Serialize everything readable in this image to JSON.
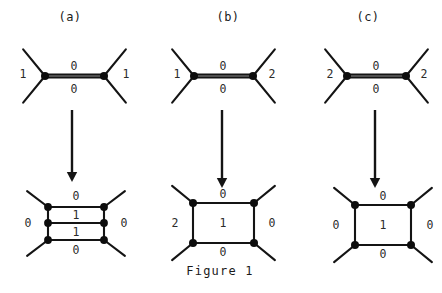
{
  "figure": {
    "caption": "Figure 1",
    "caption_x": 220,
    "caption_y": 271,
    "width": 442,
    "height": 293,
    "background_color": "#ffffff",
    "ink_color": "#141414"
  },
  "panels": [
    {
      "id": "a",
      "label": "(a)",
      "label_x": 70,
      "label_y": 10,
      "top_graph": {
        "type": "two-trivalent-vertices",
        "left_vertex": {
          "x": 45,
          "y": 76
        },
        "right_vertex": {
          "x": 104,
          "y": 76
        },
        "leg_length": 28,
        "labels": [
          {
            "name": "left-leg-label",
            "text": "1",
            "x": 23,
            "y": 74
          },
          {
            "name": "top-edge-label",
            "text": "0",
            "x": 74,
            "y": 66
          },
          {
            "name": "bottom-edge-label",
            "text": "0",
            "x": 74,
            "y": 89
          },
          {
            "name": "right-leg-label",
            "text": "1",
            "x": 126,
            "y": 74
          }
        ]
      },
      "arrow": {
        "x": 72,
        "y_start": 110,
        "y_end": 182
      },
      "bottom_graph": {
        "type": "ladder",
        "rungs": 3,
        "left_x": 48,
        "right_x": 104,
        "rung_ys": [
          207,
          223,
          240
        ],
        "leg_length": 22,
        "labels": [
          {
            "name": "top-label",
            "text": "0",
            "x": 76,
            "y": 196
          },
          {
            "name": "upper-cell-label",
            "text": "1",
            "x": 76,
            "y": 215
          },
          {
            "name": "lower-cell-label",
            "text": "1",
            "x": 76,
            "y": 232
          },
          {
            "name": "bottom-label",
            "text": "0",
            "x": 76,
            "y": 250
          },
          {
            "name": "left-label",
            "text": "0",
            "x": 28,
            "y": 223
          },
          {
            "name": "right-label",
            "text": "0",
            "x": 124,
            "y": 223
          }
        ]
      }
    },
    {
      "id": "b",
      "label": "(b)",
      "label_x": 228,
      "label_y": 10,
      "top_graph": {
        "type": "two-trivalent-vertices",
        "left_vertex": {
          "x": 194,
          "y": 76
        },
        "right_vertex": {
          "x": 253,
          "y": 76
        },
        "leg_length": 28,
        "labels": [
          {
            "name": "left-leg-label",
            "text": "1",
            "x": 177,
            "y": 74
          },
          {
            "name": "top-edge-label",
            "text": "0",
            "x": 223,
            "y": 66
          },
          {
            "name": "bottom-edge-label",
            "text": "0",
            "x": 223,
            "y": 89
          },
          {
            "name": "right-leg-label",
            "text": "2",
            "x": 272,
            "y": 74
          }
        ]
      },
      "arrow": {
        "x": 222,
        "y_start": 110,
        "y_end": 188
      },
      "bottom_graph": {
        "type": "square",
        "left_x": 193,
        "right_x": 254,
        "top_y": 203,
        "bottom_y": 243,
        "leg_length": 22,
        "labels": [
          {
            "name": "top-label",
            "text": "0",
            "x": 223,
            "y": 194
          },
          {
            "name": "center-label",
            "text": "1",
            "x": 223,
            "y": 223
          },
          {
            "name": "bottom-label",
            "text": "0",
            "x": 223,
            "y": 252
          },
          {
            "name": "left-label",
            "text": "2",
            "x": 175,
            "y": 223
          },
          {
            "name": "right-label",
            "text": "0",
            "x": 272,
            "y": 223
          }
        ]
      }
    },
    {
      "id": "c",
      "label": "(c)",
      "label_x": 368,
      "label_y": 10,
      "top_graph": {
        "type": "two-trivalent-vertices",
        "left_vertex": {
          "x": 347,
          "y": 76
        },
        "right_vertex": {
          "x": 406,
          "y": 76
        },
        "leg_length": 28,
        "labels": [
          {
            "name": "left-leg-label",
            "text": "2",
            "x": 330,
            "y": 74
          },
          {
            "name": "top-edge-label",
            "text": "0",
            "x": 376,
            "y": 66
          },
          {
            "name": "bottom-edge-label",
            "text": "0",
            "x": 376,
            "y": 89
          },
          {
            "name": "right-leg-label",
            "text": "2",
            "x": 424,
            "y": 74
          }
        ]
      },
      "arrow": {
        "x": 375,
        "y_start": 110,
        "y_end": 188
      },
      "bottom_graph": {
        "type": "square",
        "left_x": 355,
        "right_x": 411,
        "top_y": 205,
        "bottom_y": 245,
        "leg_length": 22,
        "labels": [
          {
            "name": "top-label",
            "text": "0",
            "x": 383,
            "y": 196
          },
          {
            "name": "center-label",
            "text": "1",
            "x": 383,
            "y": 225
          },
          {
            "name": "bottom-label",
            "text": "0",
            "x": 383,
            "y": 254
          },
          {
            "name": "left-label",
            "text": "0",
            "x": 336,
            "y": 225
          },
          {
            "name": "right-label",
            "text": "0",
            "x": 430,
            "y": 225
          }
        ]
      }
    }
  ]
}
